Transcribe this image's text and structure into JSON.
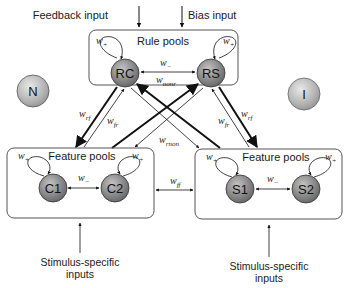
{
  "inputs": {
    "feedback": "Feedback input",
    "bias": "Bias input",
    "stimulus_left_line1": "Stimulus-specific",
    "stimulus_left_line2": "inputs",
    "stimulus_right_line1": "Stimulus-specific",
    "stimulus_right_line2": "inputs"
  },
  "rule_box": {
    "title": "Rule pools",
    "nodes": [
      {
        "label": "RC"
      },
      {
        "label": "RS"
      }
    ],
    "w_plus_left": "w",
    "w_plus_right": "w",
    "w_minus": "w",
    "w_nonr": "w"
  },
  "feature_left": {
    "title": "Feature pools",
    "nodes": [
      {
        "label": "C1"
      },
      {
        "label": "C2"
      }
    ],
    "w_plus_left": "w",
    "w_plus_right": "w",
    "w_minus": "w"
  },
  "feature_right": {
    "title": "Feature pools",
    "nodes": [
      {
        "label": "S1"
      },
      {
        "label": "S2"
      }
    ],
    "w_plus_left": "w",
    "w_plus_right": "w",
    "w_minus": "w"
  },
  "external_nodes": [
    {
      "label": "N"
    },
    {
      "label": "I"
    }
  ],
  "connection_labels": {
    "w_rf_left": "w",
    "w_fr_left": "w",
    "w_rf_right": "w",
    "w_fr_right": "w",
    "w_rnon": "w",
    "w_ff": "w"
  },
  "subscripts": {
    "plus": "+",
    "minus": "−",
    "nonr": "nonr",
    "rf": "rf",
    "fr": "fr",
    "rnon": "rnon",
    "ff": "ff"
  },
  "colors": {
    "pool_node_fill": "#8a8a8a",
    "pool_node_highlight": "#c8c8c8",
    "external_node_fill": "#b8b8b8",
    "external_node_highlight": "#e6e6e6",
    "line": "#111111",
    "box_stroke": "#555555"
  }
}
